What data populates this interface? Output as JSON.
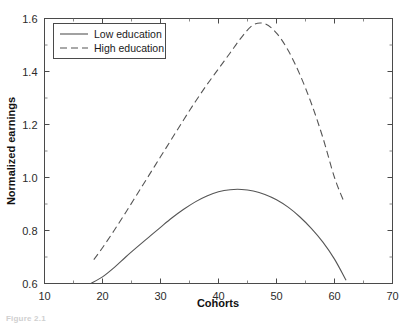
{
  "figure": {
    "caption": "Figure 2.1"
  },
  "chart_data": {
    "type": "line",
    "title": "",
    "xlabel": "Cohorts",
    "ylabel": "Normalized earnings",
    "xlim": [
      10,
      70
    ],
    "ylim": [
      0.6,
      1.6
    ],
    "xticks": [
      10,
      20,
      30,
      40,
      50,
      60,
      70
    ],
    "xtick_labels": [
      "10",
      "20",
      "30",
      "40",
      "50",
      "60",
      "70"
    ],
    "xminor_step": 5,
    "yticks": [
      0.6,
      0.8,
      1.0,
      1.2,
      1.4,
      1.6
    ],
    "ytick_labels": [
      "0.6",
      "0.8",
      "1.0",
      "1.2",
      "1.4",
      "1.6"
    ],
    "yminor_step": 0.1,
    "grid": false,
    "legend_position": "upper-left",
    "series": [
      {
        "name": "Low education",
        "style": "solid",
        "color": "#555555",
        "x": [
          18.0,
          20,
          22,
          24,
          26,
          28,
          30,
          32,
          34,
          36,
          38,
          40,
          42,
          44,
          46,
          48,
          50,
          52,
          54,
          56,
          58,
          60,
          62.0
        ],
        "y": [
          0.6,
          0.625,
          0.66,
          0.7,
          0.738,
          0.775,
          0.812,
          0.848,
          0.88,
          0.908,
          0.93,
          0.946,
          0.954,
          0.955,
          0.949,
          0.936,
          0.916,
          0.888,
          0.852,
          0.808,
          0.756,
          0.692,
          0.612
        ]
      },
      {
        "name": "High education",
        "style": "dashed",
        "color": "#555555",
        "x": [
          18.5,
          20,
          22,
          24,
          26,
          28,
          30,
          32,
          34,
          36,
          38,
          40,
          42,
          44,
          46,
          48,
          50,
          52,
          54,
          56,
          58,
          60,
          61.6
        ],
        "y": [
          0.69,
          0.735,
          0.8,
          0.868,
          0.938,
          1.008,
          1.078,
          1.148,
          1.218,
          1.286,
          1.35,
          1.41,
          1.47,
          1.53,
          1.576,
          1.58,
          1.545,
          1.48,
          1.39,
          1.28,
          1.15,
          1.0,
          0.91
        ]
      }
    ]
  }
}
